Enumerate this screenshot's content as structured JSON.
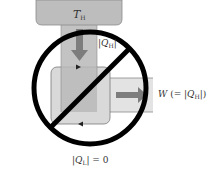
{
  "diagram": {
    "hot_reservoir": {
      "label_symbol": "T",
      "label_subscript": "H"
    },
    "heat_in": {
      "prefix": "|",
      "symbol": "Q",
      "subscript": "H",
      "suffix": "|"
    },
    "work_out": {
      "symbol": "W",
      "middle": " (= |",
      "inner_symbol": "Q",
      "inner_subscript": "H",
      "suffix": "|)"
    },
    "heat_out": {
      "prefix": "|",
      "symbol": "Q",
      "subscript": "L",
      "suffix": "| = 0"
    },
    "prohibition_sign": "circle-slash",
    "colors": {
      "reservoir": "#bdbdbd",
      "column": "#b8b8b8",
      "engine_box": "#d9d9d9",
      "engine_border": "#7a7a7a",
      "band": "#e3e3e3",
      "arrow": "#7d7d7d",
      "sign": "#000000"
    }
  }
}
